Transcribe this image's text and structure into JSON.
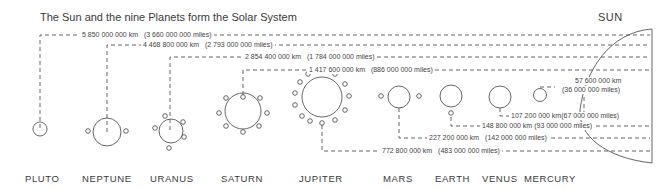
{
  "title": "The Sun and the nine Planets form the Solar System",
  "sun": {
    "label": "SUN"
  },
  "planets": [
    {
      "name": "PLUTO",
      "km": "5 850 000 000 km",
      "miles": "(3 660 000 000 miles)"
    },
    {
      "name": "NEPTUNE",
      "km": "4 468 800 000 km",
      "miles": "(2 793 000 000 miles)"
    },
    {
      "name": "URANUS",
      "km": "2 854 400 000 km",
      "miles": "(1 784 000 000 miles)"
    },
    {
      "name": "SATURN",
      "km": "1 417 600 000 km",
      "miles": "(886 000 000 miles)"
    },
    {
      "name": "JUPITER",
      "km": "772 800 000 km",
      "miles": "(483 000 000 miles)"
    },
    {
      "name": "MARS",
      "km": "227 200 000 km",
      "miles": "(142 000 000 miles)"
    },
    {
      "name": "EARTH",
      "km": "148 800 000 km",
      "miles": "(93 000 000 miles)"
    },
    {
      "name": "VENUS",
      "km": "107 200 000 km",
      "miles": "(67 000 000 miles)"
    },
    {
      "name": "MERCURY",
      "km": "57 600 000 km",
      "miles": "(36 000 000 miles)"
    }
  ]
}
